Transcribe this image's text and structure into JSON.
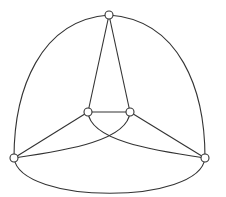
{
  "diagram": {
    "type": "graph",
    "colors": {
      "stroke": "#333333",
      "background": "#ffffff",
      "node_fill": "#ffffff"
    },
    "nodes": [
      {
        "id": "top",
        "x": 109,
        "y": 15
      },
      {
        "id": "inner-left",
        "x": 88,
        "y": 112
      },
      {
        "id": "inner-right",
        "x": 130,
        "y": 112
      },
      {
        "id": "outer-left",
        "x": 14,
        "y": 158
      },
      {
        "id": "outer-right",
        "x": 205,
        "y": 158
      }
    ],
    "edges": [
      {
        "from": "top",
        "to": "outer-left",
        "shape": "curve"
      },
      {
        "from": "top",
        "to": "outer-right",
        "shape": "curve"
      },
      {
        "from": "outer-left",
        "to": "outer-right",
        "shape": "curve"
      },
      {
        "from": "top",
        "to": "inner-left",
        "shape": "line"
      },
      {
        "from": "top",
        "to": "inner-right",
        "shape": "line"
      },
      {
        "from": "inner-left",
        "to": "inner-right",
        "shape": "line"
      },
      {
        "from": "inner-left",
        "to": "outer-left",
        "shape": "line"
      },
      {
        "from": "inner-right",
        "to": "outer-right",
        "shape": "line"
      },
      {
        "from": "inner-left",
        "to": "outer-right",
        "shape": "curve"
      },
      {
        "from": "inner-right",
        "to": "outer-left",
        "shape": "curve"
      }
    ]
  }
}
